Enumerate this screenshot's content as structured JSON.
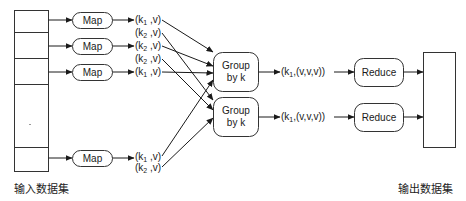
{
  "diagram": {
    "type": "mapreduce-flow",
    "input_dataset": {
      "label": "输入数据集",
      "segments": 5
    },
    "output_dataset": {
      "label": "输出数据集"
    },
    "map_nodes": [
      {
        "label": "Map",
        "outputs": [
          {
            "key": "k",
            "sub": "1",
            "val": "v",
            "target": 0
          },
          {
            "key": "k",
            "sub": "2",
            "val": "v",
            "target": 1
          }
        ]
      },
      {
        "label": "Map",
        "outputs": [
          {
            "key": "k",
            "sub": "2",
            "val": "v",
            "target": 0
          },
          {
            "key": "k",
            "sub": "2",
            "val": "v",
            "target": 1
          }
        ]
      },
      {
        "label": "Map",
        "outputs": [
          {
            "key": "k",
            "sub": "1",
            "val": "v",
            "target": 0
          }
        ]
      },
      {
        "label": "Map",
        "outputs": [
          {
            "key": "k",
            "sub": "1",
            "val": "v",
            "target": 0
          },
          {
            "key": "k",
            "sub": "2",
            "val": "v",
            "target": 1
          }
        ]
      }
    ],
    "group_nodes": [
      {
        "line1": "Group",
        "line2": "by k"
      },
      {
        "line1": "Group",
        "line2": "by k"
      }
    ],
    "grouped_outputs": [
      {
        "key": "k",
        "sub": "1",
        "vals": "(v,v,v)"
      },
      {
        "key": "k",
        "sub": "1",
        "vals": "(v,v,v)"
      }
    ],
    "reduce_nodes": [
      {
        "label": "Reduce"
      },
      {
        "label": "Reduce"
      }
    ]
  },
  "labels": {
    "map0": "Map",
    "map1": "Map",
    "map2": "Map",
    "map3": "Map",
    "group0_l1": "Group",
    "group0_l2": "by k",
    "group1_l1": "Group",
    "group1_l2": "by k",
    "reduce0": "Reduce",
    "reduce1": "Reduce",
    "input_caption": "输入数据集",
    "output_caption": "输出数据集",
    "pairs": [
      {
        "k": "(k",
        "s": "1",
        "rest": " ,v)"
      },
      {
        "k": "(k",
        "s": "2",
        "rest": " ,v)"
      },
      {
        "k": "(k",
        "s": "2",
        "rest": " ,v)"
      },
      {
        "k": "(k",
        "s": "2",
        "rest": " ,v)"
      },
      {
        "k": "(k",
        "s": "1",
        "rest": " ,v)"
      },
      {
        "k": "(k",
        "s": "1",
        "rest": " ,v)"
      },
      {
        "k": "(k",
        "s": "2",
        "rest": " ,v)"
      }
    ],
    "grouped": [
      {
        "k": "(k",
        "s": "1",
        "rest": ",(v,v,v))"
      },
      {
        "k": "(k",
        "s": "1",
        "rest": ",(v,v,v))"
      }
    ]
  }
}
